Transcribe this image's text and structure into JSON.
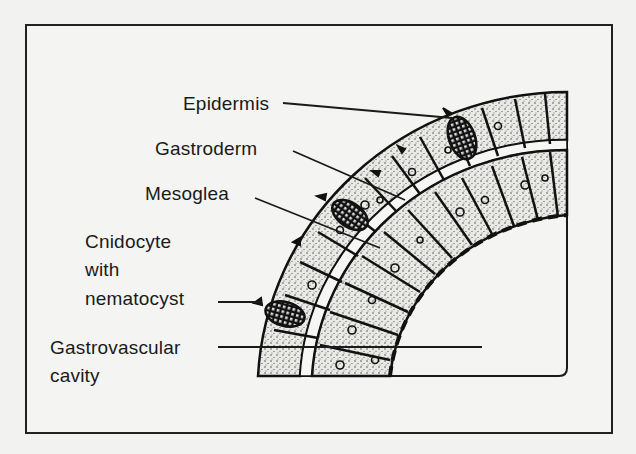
{
  "figure": {
    "type": "biological cross-section diagram",
    "labels": {
      "epidermis": "Epidermis",
      "gastroderm": "Gastroderm",
      "mesoglea": "Mesoglea",
      "cnidocyte_line1": "Cnidocyte",
      "cnidocyte_line2": "with",
      "cnidocyte_line3": "nematocyst",
      "gastrovascular_line1": "Gastrovascular",
      "gastrovascular_line2": "cavity"
    },
    "colors": {
      "ink": "#1a1a1a",
      "paper": "#f4f4f2"
    }
  }
}
